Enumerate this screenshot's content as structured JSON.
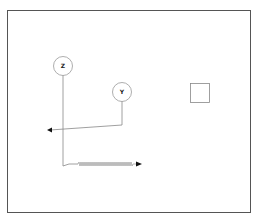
{
  "diagram": {
    "frame": {
      "x": 7,
      "y": 10,
      "width": 244,
      "height": 203,
      "stroke": "#555555"
    },
    "nodes": [
      {
        "id": "z",
        "label": "Z",
        "cx": 63,
        "cy": 66,
        "r": 9.5
      },
      {
        "id": "y",
        "label": "Y",
        "cx": 122,
        "cy": 92,
        "r": 9.5
      }
    ],
    "boxes": [
      {
        "id": "square",
        "x": 190,
        "y": 83,
        "width": 19,
        "height": 19
      }
    ],
    "edges": [
      {
        "from": "y",
        "style": "solid",
        "arrow": "end",
        "direction": "left"
      },
      {
        "from": "z",
        "style": "zigzag",
        "arrow": "end",
        "direction": "right"
      }
    ],
    "colors": {
      "line": "#888888",
      "arrow": "#111111",
      "circle": "#999999"
    }
  }
}
